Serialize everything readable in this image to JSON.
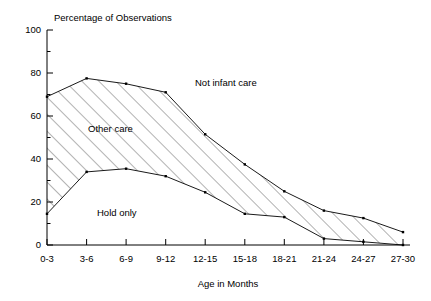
{
  "chart_data": {
    "type": "area",
    "title": "Percentage of Observations",
    "xlabel": "Age in Months",
    "ylabel": "Percentage of Observations",
    "categories": [
      "0-3",
      "3-6",
      "6-9",
      "9-12",
      "12-15",
      "15-18",
      "18-21",
      "21-24",
      "24-27",
      "27-30"
    ],
    "ylim": [
      0,
      100
    ],
    "ytick_labels": [
      "0",
      "20",
      "40",
      "60",
      "80",
      "100"
    ],
    "yticks": [
      0,
      20,
      40,
      60,
      80,
      100
    ],
    "yminor_step": 10,
    "grid": false,
    "legend": "inline-annotations",
    "series": [
      {
        "name": "Infant care upper boundary (Other care top)",
        "label": "Other care",
        "values": [
          69,
          77.5,
          75,
          71,
          51.5,
          37.5,
          25,
          16,
          12.5,
          6
        ]
      },
      {
        "name": "Hold only upper boundary",
        "label": "Hold only",
        "values": [
          14.5,
          34,
          35.5,
          32,
          24.5,
          14.5,
          13,
          3,
          1.5,
          0
        ]
      }
    ],
    "annotations": [
      {
        "text": "Not infant care",
        "x_px": 195,
        "y_px": 86,
        "region": "above-upper-curve"
      },
      {
        "text": "Other care",
        "x_px": 88,
        "y_px": 132,
        "region": "hatched-band"
      },
      {
        "text": "Hold only",
        "x_px": 97,
        "y_px": 216,
        "region": "below-lower-curve"
      }
    ],
    "hatch": {
      "pattern": "diagonal-lines",
      "angle_deg": 45,
      "color": "#555555"
    }
  },
  "axes": {
    "x_axis_label": "Age in Months",
    "y_axis_header": "Percentage of Observations"
  },
  "colors": {
    "line": "#000000",
    "hatch": "#555555",
    "background": "#ffffff",
    "text": "#000000"
  }
}
